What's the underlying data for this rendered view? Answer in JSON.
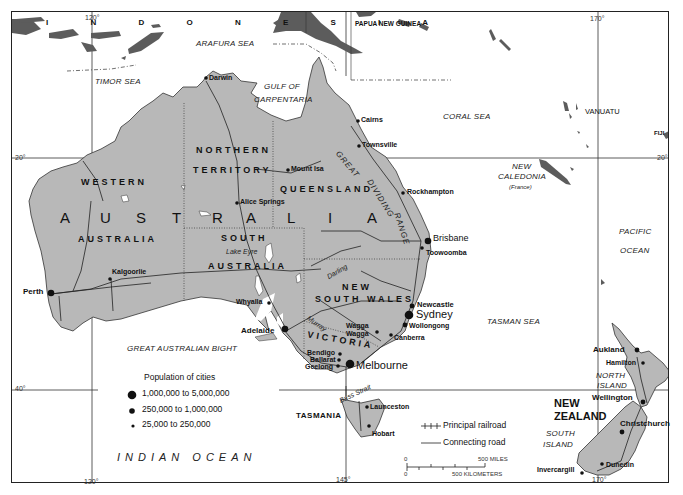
{
  "map": {
    "colors": {
      "land": "#b8b8b8",
      "foreign_land": "#5c5c5c",
      "water": "#ffffff",
      "line": "#222222"
    },
    "countries": {
      "indonesia": "I N D O N E S I A",
      "papua_new_guinea": "PAPUA NEW GUINEA",
      "australia": "AUSTRALIA",
      "vanuatu": "VANUATU",
      "fiji": "FIJI",
      "new_caledonia": "NEW",
      "new_caledonia_2": "CALEDONIA",
      "new_caledonia_note": "(France)",
      "new_zealand_1": "NEW",
      "new_zealand_2": "ZEALAND"
    },
    "australia_letters": [
      "A",
      "U",
      "S",
      "T",
      "R",
      "A",
      "L",
      "I",
      "A"
    ],
    "seas": {
      "arafura": "ARAFURA SEA",
      "timor": "TIMOR SEA",
      "gulf_1": "GULF OF",
      "gulf_2": "CARPENTARIA",
      "coral": "CORAL SEA",
      "tasman": "TASMAN SEA",
      "bight": "GREAT AUSTRALIAN BIGHT",
      "indian": "INDIAN OCEAN",
      "pacific_1": "PACIFIC",
      "pacific_2": "OCEAN",
      "bass_strait": "Bass Strait"
    },
    "regions": {
      "nt_1": "NORTHERN",
      "nt_2": "TERRITORY",
      "wa_1": "WESTERN",
      "wa_2": "AUSTRALIA",
      "qld": "QUEENSLAND",
      "sa_1": "SOUTH",
      "sa_2": "AUSTRALIA",
      "nsw_1": "NEW",
      "nsw_2": "SOUTH WALES",
      "vic": "VICTORIA",
      "tas": "TASMANIA",
      "north_island_1": "NORTH",
      "north_island_2": "ISLAND",
      "south_island_1": "SOUTH",
      "south_island_2": "ISLAND"
    },
    "features": {
      "great_dividing_1": "GREAT",
      "great_dividing_2": "DIVIDING",
      "great_dividing_3": "RANGE",
      "lake_eyre": "Lake Eyre",
      "darling": "Darling",
      "murray": "Murray"
    },
    "cities": [
      {
        "name": "Darwin",
        "size": "small"
      },
      {
        "name": "Cairns",
        "size": "small"
      },
      {
        "name": "Townsville",
        "size": "small"
      },
      {
        "name": "Mount Isa",
        "size": "small"
      },
      {
        "name": "Alice Springs",
        "size": "small"
      },
      {
        "name": "Rockhampton",
        "size": "small"
      },
      {
        "name": "Brisbane",
        "size": "large"
      },
      {
        "name": "Toowoomba",
        "size": "small"
      },
      {
        "name": "Kalgoorlie",
        "size": "small"
      },
      {
        "name": "Perth",
        "size": "large"
      },
      {
        "name": "Whyalla",
        "size": "small"
      },
      {
        "name": "Adelaide",
        "size": "large"
      },
      {
        "name": "Newcastle",
        "size": "medium"
      },
      {
        "name": "Sydney",
        "size": "xlarge"
      },
      {
        "name": "Wollongong",
        "size": "medium"
      },
      {
        "name": "Wagga",
        "size": "small"
      },
      {
        "name": "Wagga",
        "size": "small"
      },
      {
        "name": "Canberra",
        "size": "small"
      },
      {
        "name": "Bendigo",
        "size": "small"
      },
      {
        "name": "Ballarat",
        "size": "small"
      },
      {
        "name": "Geelong",
        "size": "small"
      },
      {
        "name": "Melbourne",
        "size": "xlarge"
      },
      {
        "name": "Launceston",
        "size": "small"
      },
      {
        "name": "Hobart",
        "size": "small"
      },
      {
        "name": "Aukland",
        "size": "medium"
      },
      {
        "name": "Hamilton",
        "size": "small"
      },
      {
        "name": "Wellington",
        "size": "medium"
      },
      {
        "name": "Christchurch",
        "size": "medium"
      },
      {
        "name": "Dunedin",
        "size": "small"
      },
      {
        "name": "Invercargill",
        "size": "small"
      }
    ],
    "coordinates": {
      "lon_120_top": "120°",
      "lon_120_bottom": "120°",
      "lon_145_bottom": "145°",
      "lon_170_top": "170°",
      "lon_170_bottom": "170°",
      "lat_20_left": "20°",
      "lat_20_right": "20°",
      "lat_40_left": "40°"
    },
    "legend": {
      "title": "Population of cities",
      "items": [
        {
          "label": "1,000,000 to 5,000,000",
          "dot": "large"
        },
        {
          "label": "250,000 to 1,000,000",
          "dot": "medium"
        },
        {
          "label": "25,000 to 250,000",
          "dot": "small"
        }
      ],
      "lines": [
        {
          "label": "Principal railroad",
          "style": "railroad"
        },
        {
          "label": "Connecting road",
          "style": "road"
        }
      ],
      "scale": {
        "miles_start": "0",
        "miles_end": "500 MILES",
        "km_start": "0",
        "km_end": "500 KILOMETERS"
      }
    }
  }
}
